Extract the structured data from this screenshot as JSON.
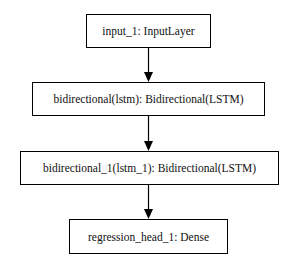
{
  "diagram": {
    "type": "flowchart",
    "nodes": [
      {
        "id": "input_1",
        "label": "input_1: InputLayer"
      },
      {
        "id": "bidirectional",
        "label": "bidirectional(lstm): Bidirectional(LSTM)"
      },
      {
        "id": "bidirectional_1",
        "label": "bidirectional_1(lstm_1): Bidirectional(LSTM)"
      },
      {
        "id": "regression_head_1",
        "label": "regression_head_1: Dense"
      }
    ],
    "edges": [
      {
        "from": "input_1",
        "to": "bidirectional"
      },
      {
        "from": "bidirectional",
        "to": "bidirectional_1"
      },
      {
        "from": "bidirectional_1",
        "to": "regression_head_1"
      }
    ]
  }
}
